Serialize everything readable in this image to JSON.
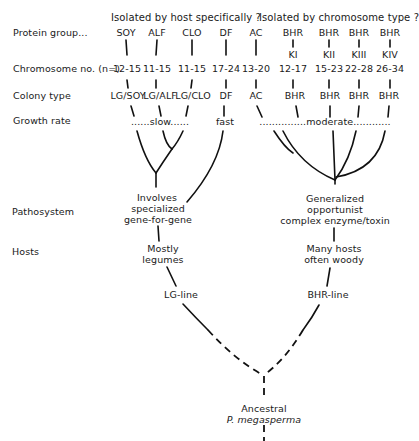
{
  "headers": {
    "host_specific": "Isolated by host specifically ?",
    "chromosome_type": "Isolated by chromosome type ?"
  },
  "row_labels": {
    "protein_group": "Protein group...",
    "chromosome_no": "Chromosome no. (n=)",
    "colony_type": "Colony type",
    "growth_rate": "Growth rate",
    "pathosystem": "Pathosystem",
    "hosts": "Hosts"
  },
  "columns": [
    {
      "protein": "SOY",
      "karyotype": "",
      "chromosomes": "12-15",
      "colony": "LG/SOY"
    },
    {
      "protein": "ALF",
      "karyotype": "",
      "chromosomes": "11-15",
      "colony": "LG/ALF"
    },
    {
      "protein": "CLO",
      "karyotype": "",
      "chromosomes": "11-15",
      "colony": "LG/CLO"
    },
    {
      "protein": "DF",
      "karyotype": "",
      "chromosomes": "17-24",
      "colony": "DF"
    },
    {
      "protein": "AC",
      "karyotype": "",
      "chromosomes": "13-20",
      "colony": "AC"
    },
    {
      "protein": "BHR",
      "karyotype": "KI",
      "chromosomes": "12-17",
      "colony": "BHR"
    },
    {
      "protein": "BHR",
      "karyotype": "KII",
      "chromosomes": "15-23",
      "colony": "BHR"
    },
    {
      "protein": "BHR",
      "karyotype": "KIII",
      "chromosomes": "22-28",
      "colony": "BHR"
    },
    {
      "protein": "BHR",
      "karyotype": "KIV",
      "chromosomes": "26-34",
      "colony": "BHR"
    }
  ],
  "growth_rates": {
    "slow": "......slow......",
    "fast": "fast",
    "moderate": "...............moderate............"
  },
  "lg_branch": {
    "pathosystem": [
      "Involves",
      "specialized",
      "gene-for-gene"
    ],
    "hosts": [
      "Mostly",
      "legumes"
    ],
    "line": "LG-line"
  },
  "bhr_branch": {
    "pathosystem": [
      "Generalized",
      "opportunist",
      "complex enzyme/toxin"
    ],
    "hosts": [
      "Many hosts",
      "often woody"
    ],
    "line": "BHR-line"
  },
  "root": {
    "label": "Ancestral",
    "species": "P. megasperma"
  }
}
